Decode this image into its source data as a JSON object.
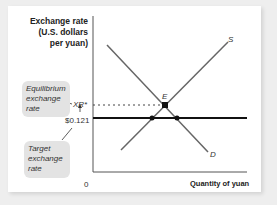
{
  "diagram": {
    "y_axis_label": "Exchange rate (U.S. dollars per yuan)",
    "x_axis_label": "Quantity of yuan",
    "origin_label": "0",
    "equilibrium_tick": "XR*",
    "target_tick": "$0.121",
    "supply_label": "S",
    "demand_label": "D",
    "equilibrium_label": "E",
    "callouts": {
      "equilibrium": "Equilibrium exchange rate",
      "target": "Target exchange rate"
    },
    "colors": {
      "curves": "#777777",
      "target_line": "#111111",
      "callout_bg": "#e3e3e3"
    }
  }
}
